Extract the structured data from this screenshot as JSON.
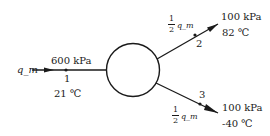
{
  "diagram": {
    "type": "flow-splitter",
    "device_shape": "circle",
    "inlet": {
      "flow_label": "q_m",
      "state_number": "1",
      "pressure": "600 kPa",
      "temperature": "21 ℃"
    },
    "outlet_top": {
      "flow_fraction_num": "1",
      "flow_fraction_den": "2",
      "flow_label": "q_m",
      "state_number": "2",
      "pressure": "100 kPa",
      "temperature": "82 ℃"
    },
    "outlet_bottom": {
      "flow_fraction_num": "1",
      "flow_fraction_den": "2",
      "flow_label": "q_m",
      "state_number": "3",
      "pressure": "100 kPa",
      "temperature": "-40 ℃"
    },
    "colors": {
      "line": "#1a1a1a",
      "background": "#ffffff"
    }
  }
}
